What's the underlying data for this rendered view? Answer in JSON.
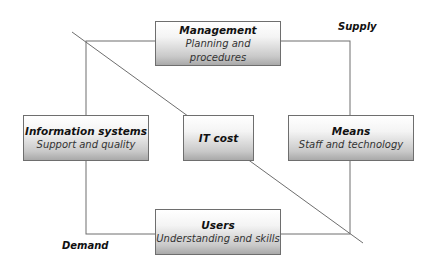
{
  "diagram": {
    "boxes": {
      "management": {
        "title": "Management",
        "subtitle": "Planning and procedures"
      },
      "information_systems": {
        "title": "Information systems",
        "subtitle": "Support and quality"
      },
      "it_cost": {
        "title": "IT cost"
      },
      "means": {
        "title": "Means",
        "subtitle": "Staff and technology"
      },
      "users": {
        "title": "Users",
        "subtitle": "Understanding and skills"
      }
    },
    "labels": {
      "supply": "Supply",
      "demand": "Demand"
    },
    "colors": {
      "line": "#6e6e6e",
      "box_gradient_top": "#ffffff",
      "box_gradient_bottom": "#a9a9a9"
    }
  }
}
